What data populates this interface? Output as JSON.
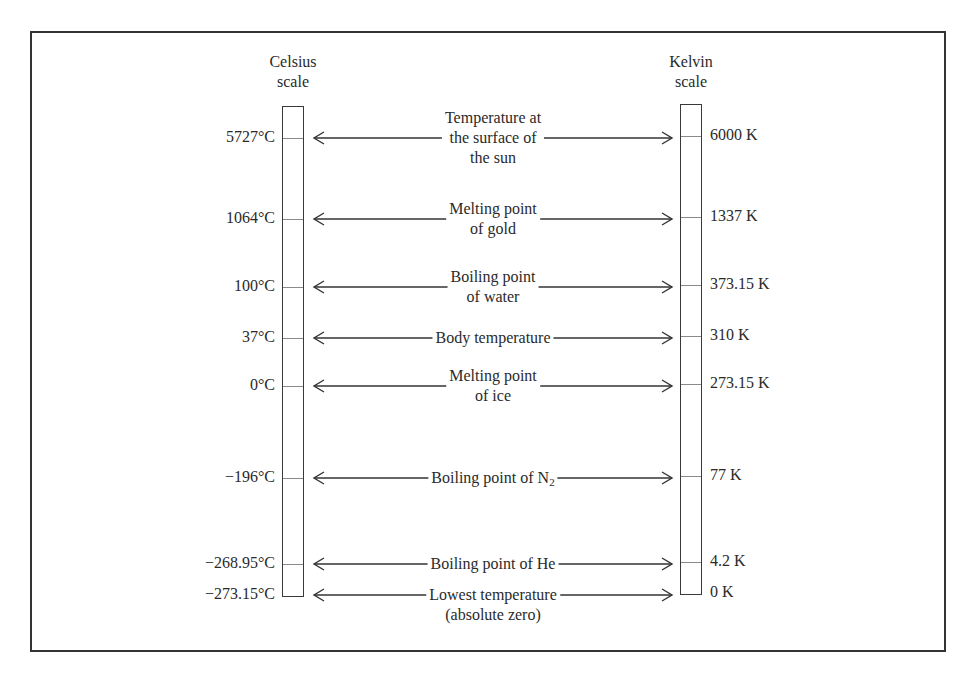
{
  "diagram": {
    "celsius_header": [
      "Celsius",
      "scale"
    ],
    "kelvin_header": [
      "Kelvin",
      "scale"
    ],
    "rows": [
      {
        "celsius": "5727°C",
        "kelvin": "6000 K",
        "label_lines": [
          "Temperature at",
          "the surface of",
          "the sun"
        ],
        "y": 138
      },
      {
        "celsius": "1064°C",
        "kelvin": "1337 K",
        "label_lines": [
          "Melting point",
          "of gold"
        ],
        "y": 219
      },
      {
        "celsius": "100°C",
        "kelvin": "373.15 K",
        "label_lines": [
          "Boiling point",
          "of water"
        ],
        "y": 287
      },
      {
        "celsius": "37°C",
        "kelvin": "310 K",
        "label_lines": [
          "Body temperature"
        ],
        "y": 338
      },
      {
        "celsius": "0°C",
        "kelvin": "273.15 K",
        "label_lines": [
          "Melting point",
          "of ice"
        ],
        "y": 386
      },
      {
        "celsius": "−196°C",
        "kelvin": "77 K",
        "label_main": "Boiling point of N",
        "label_sub": "2",
        "label_lines": [
          "Boiling point of N2"
        ],
        "y": 478
      },
      {
        "celsius": "−268.95°C",
        "kelvin": "4.2 K",
        "label_lines": [
          "Boiling point of He"
        ],
        "y": 564
      },
      {
        "celsius": "−273.15°C",
        "kelvin": "0 K",
        "label_lines": [
          "Lowest temperature",
          "(absolute zero)"
        ],
        "y": 595
      }
    ],
    "colors": {
      "line": "#333333",
      "tick": "#8a8a8a",
      "text": "#2a2a2a"
    }
  }
}
